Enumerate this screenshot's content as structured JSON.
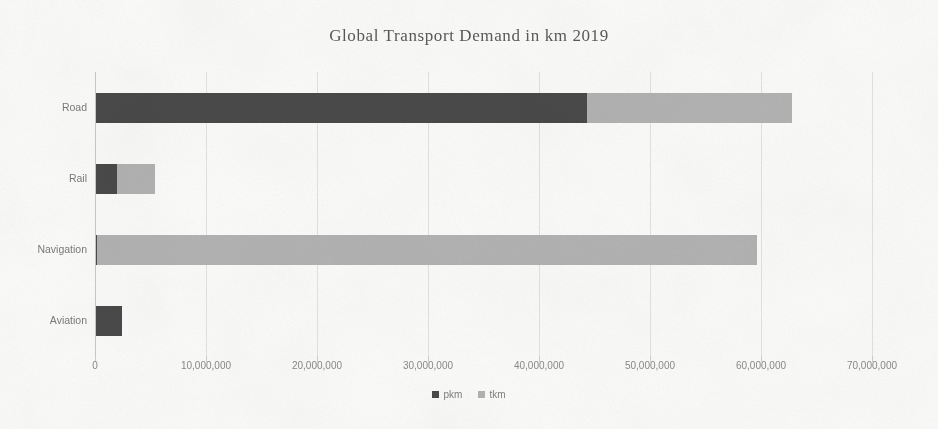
{
  "chart_data": {
    "type": "bar",
    "orientation": "horizontal",
    "stacked": true,
    "title": "Global Transport Demand in km 2019",
    "xlabel": "",
    "ylabel": "",
    "xlim": [
      0,
      70000000
    ],
    "grid": true,
    "legend_position": "bottom",
    "categories": [
      "Road",
      "Rail",
      "Navigation",
      "Aviation"
    ],
    "series": [
      {
        "name": "pkm",
        "color": "#4a4a4a",
        "values": [
          44300000,
          2000000,
          200000,
          2400000
        ]
      },
      {
        "name": "tkm",
        "color": "#b3b3b3",
        "values": [
          18500000,
          3400000,
          59400000,
          0
        ]
      }
    ],
    "xticks": [
      0,
      10000000,
      20000000,
      30000000,
      40000000,
      50000000,
      60000000,
      70000000
    ],
    "xtick_labels": [
      "0",
      "10,000,000",
      "20,000,000",
      "30,000,000",
      "40,000,000",
      "50,000,000",
      "60,000,000",
      "70,000,000"
    ]
  },
  "colors": {
    "background": "#fbfbfa",
    "pkm": "#4a4a4a",
    "tkm": "#b3b3b3",
    "gridline": "#e3e3e1",
    "axis": "#c9c9c6",
    "title_text": "#5a5a58",
    "label_text": "#7b7b79"
  }
}
